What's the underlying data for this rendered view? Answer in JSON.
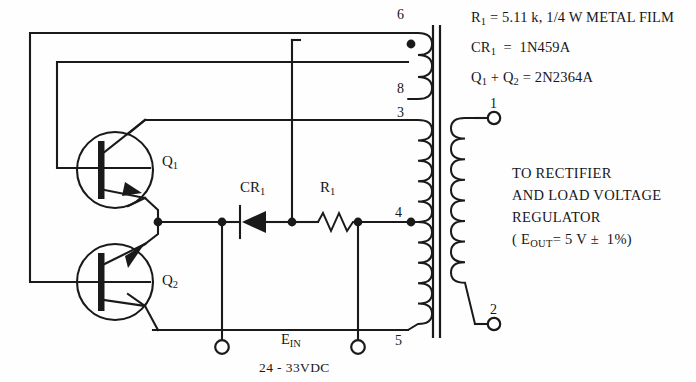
{
  "figure": {
    "kind": "electronic-schematic"
  },
  "colors": {
    "ink": "#17171a",
    "background": "#fefefe",
    "wire": "#1a1a1a"
  },
  "notes": {
    "line1": {
      "name": "R",
      "sub": "1",
      "rest": " = 5.11 k, 1/4 W METAL FILM"
    },
    "line2": {
      "name": "CR",
      "sub": "1",
      "rest": "  =  1N459A"
    },
    "line3": {
      "name_a": "Q",
      "sub_a": "1",
      "mid": " + ",
      "name_b": "Q",
      "sub_b": "2",
      "rest": " = 2N2364A"
    }
  },
  "destination": {
    "line1": "TO RECTIFIER",
    "line2": "AND LOAD VOLTAGE",
    "line3": "REGULATOR",
    "line4_prefix": "( E",
    "line4_sub": "OUT",
    "line4_rest": "= 5 V ±  1%)"
  },
  "components": {
    "q1_label": "Q",
    "q1_sub": "1",
    "q2_label": "Q",
    "q2_sub": "2",
    "cr1_label": "CR",
    "cr1_sub": "1",
    "r1_label": "R",
    "r1_sub": "1"
  },
  "input": {
    "label_main": "E",
    "label_sub": "IN",
    "range": "24 - 33VDC"
  },
  "transformer": {
    "primary_terminals": [
      "6",
      "8",
      "3",
      "4",
      "5"
    ],
    "secondary_terminals": [
      "1",
      "2"
    ]
  }
}
